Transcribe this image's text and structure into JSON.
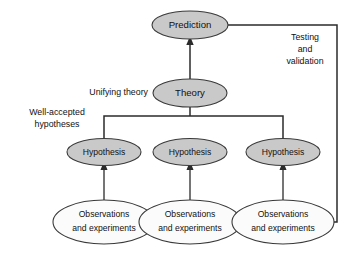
{
  "diagram": {
    "colors": {
      "node_fill_gray": "#c9c9c9",
      "node_fill_white": "#fbfbfb",
      "node_stroke": "#3a3a3a",
      "connector": "#2b2b2b",
      "text": "#111111",
      "background": "#ffffff"
    },
    "nodes": {
      "prediction": {
        "label": "Prediction",
        "fill": "gray"
      },
      "theory": {
        "label": "Theory",
        "fill": "gray"
      },
      "hypothesis_left": {
        "label": "Hypothesis",
        "fill": "gray"
      },
      "hypothesis_center": {
        "label": "Hypothesis",
        "fill": "gray"
      },
      "hypothesis_right": {
        "label": "Hypothesis",
        "fill": "gray"
      },
      "observations_left": {
        "line1": "Observations",
        "line2": "and experiments",
        "fill": "white"
      },
      "observations_center": {
        "line1": "Observations",
        "line2": "and experiments",
        "fill": "white"
      },
      "observations_right": {
        "line1": "Observations",
        "line2": "and experiments",
        "fill": "white"
      }
    },
    "labels": {
      "unifying_theory": "Unifying theory",
      "well_accepted_line1": "Well-accepted",
      "well_accepted_line2": "hypotheses",
      "testing_line1": "Testing",
      "testing_line2": "and",
      "testing_line3": "validation"
    }
  }
}
